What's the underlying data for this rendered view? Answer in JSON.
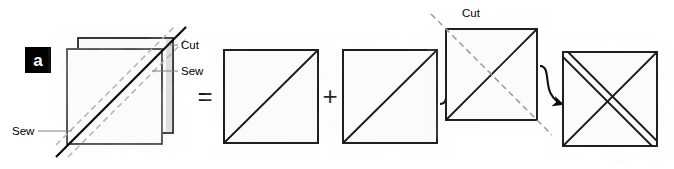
{
  "figure": {
    "panel_label": "a",
    "background_color": "#ffffff",
    "ink_color": "#000000",
    "dashed_guide_color": "#b4b4b4",
    "leader_line_color": "#808080",
    "fabric_fill_color": "#fcfcfc",
    "fabric_shadow_color": "#d8d8d8",
    "width": 674,
    "height": 169
  },
  "labels": {
    "cut_top_left": "Cut",
    "sew_top_right": "Sew",
    "sew_bottom_left": "Sew",
    "cut_step_three": "Cut"
  },
  "operators": {
    "equals": "=",
    "plus": "+"
  },
  "steps": [
    {
      "id": "stacked-fabric",
      "name": "stacked-squares",
      "description": "Two fabric squares stacked with offset, marked with a solid sewing diagonal and two dashed seam guides"
    },
    {
      "id": "triangle-unit-one",
      "name": "half-square-unit-1",
      "description": "Square with single diagonal seam from bottom-left to top-right"
    },
    {
      "id": "triangle-unit-two",
      "name": "half-square-unit-2",
      "description": "Square with single diagonal seam from bottom-left to top-right"
    },
    {
      "id": "crossed-unit",
      "name": "crossed-square-with-cut-line",
      "description": "Square with solid diagonal and dashed cut line on the opposing diagonal"
    },
    {
      "id": "final-unit",
      "name": "quarter-square-unit",
      "description": "Square with full X; one diagonal shown as a double seam line"
    }
  ],
  "icons": {
    "arrow_one": "curved-arrow-right-up",
    "arrow_two": "curved-arrow-right-down"
  }
}
